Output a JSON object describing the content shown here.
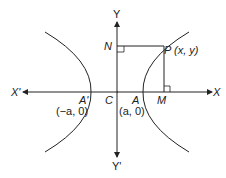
{
  "diagram": {
    "labels": {
      "y_top": "Y",
      "y_bottom": "Y'",
      "x_left": "X'",
      "x_right": "X",
      "n": "N",
      "p": "P (x, y)",
      "a_prime": "A'",
      "a_prime_coord": "(−a, 0)",
      "c": "C",
      "a": "A",
      "a_coord": "(a, 0)",
      "m": "M"
    },
    "colors": {
      "stroke": "#222222",
      "background": "#ffffff"
    }
  }
}
